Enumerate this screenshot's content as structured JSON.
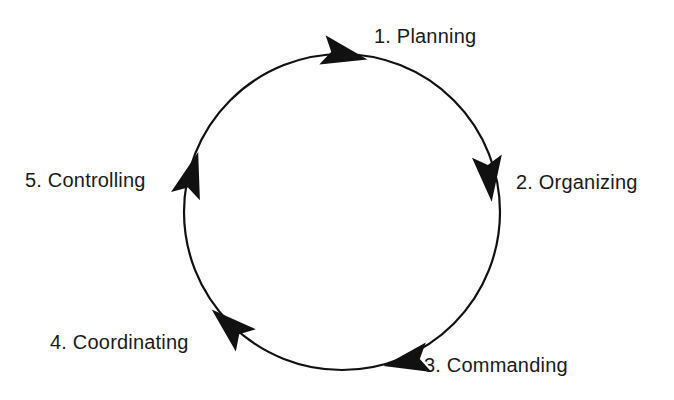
{
  "diagram": {
    "type": "cyclic-process",
    "direction": "clockwise",
    "background_color": "#ffffff",
    "stroke_color": "#111111",
    "text_color": "#1a1a1a",
    "circle": {
      "center_x": 342,
      "center_y": 212,
      "radius": 158
    },
    "stages": [
      {
        "index": "1",
        "label": "1. Planning",
        "name": "Planning",
        "angle_deg": 0
      },
      {
        "index": "2",
        "label": "2. Organizing",
        "name": "Organizing",
        "angle_deg": 72
      },
      {
        "index": "3",
        "label": "3. Commanding",
        "name": "Commanding",
        "angle_deg": 144
      },
      {
        "index": "4",
        "label": "4. Coordinating",
        "name": "Coordinating",
        "angle_deg": 216
      },
      {
        "index": "5",
        "label": "5. Controlling",
        "name": "Controlling",
        "angle_deg": 288
      }
    ]
  }
}
